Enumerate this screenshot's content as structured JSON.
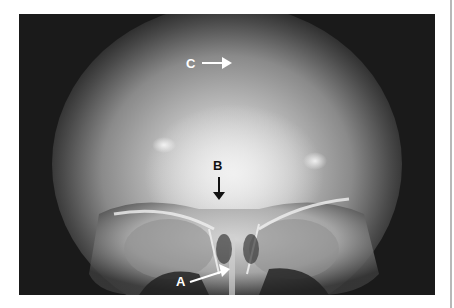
{
  "figure": {
    "type": "radiograph",
    "view": "frontal skull X-ray",
    "colors": {
      "background": "#1a1a1a",
      "page": "#ffffff",
      "rule": "#b8b8b8"
    },
    "annotations": [
      {
        "id": "C",
        "label": "C",
        "arrow_direction": "right",
        "label_color": "#ffffff"
      },
      {
        "id": "B",
        "label": "B",
        "arrow_direction": "down",
        "label_color": "#111111"
      },
      {
        "id": "A",
        "label": "A",
        "arrow_direction": "up-right",
        "label_color": "#ffffff"
      }
    ]
  }
}
